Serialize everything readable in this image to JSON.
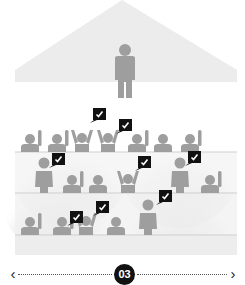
{
  "diagram": {
    "colors": {
      "figure": "#9e9e9e",
      "roof": "#ececec",
      "tier": "#f1f1f1",
      "tier_line": "#d4d4d4",
      "halo": "#e3e3e3",
      "bubble": "#111111",
      "check": "#ffffff"
    },
    "presenter": {
      "icon": "person-standing-icon"
    },
    "check_bubbles_count": 8,
    "check_icon": "checkmark-speech-bubble-icon"
  },
  "pager": {
    "prev_icon": "chevron-left-icon",
    "prev_glyph": "‹",
    "current_page": "03",
    "next_icon": "chevron-right-icon",
    "next_glyph": "›"
  }
}
